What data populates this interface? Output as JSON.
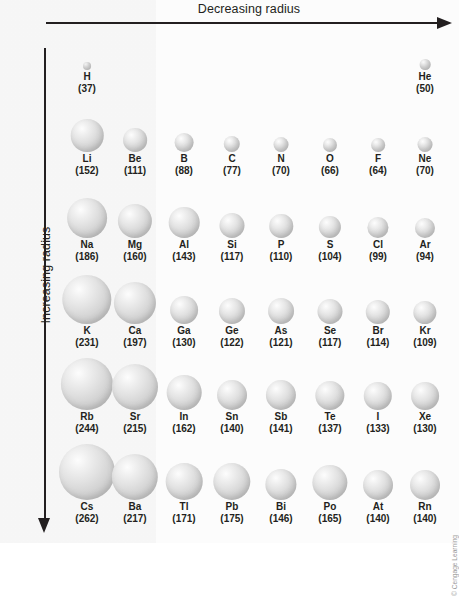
{
  "figure": {
    "top_axis_label": "Decreasing radius",
    "left_axis_label": "Increasing radius",
    "copyright": "© Cengage Learning"
  },
  "chart_data": {
    "type": "scatter",
    "xlabel": "Decreasing radius",
    "ylabel": "Increasing radius",
    "unit": "pm",
    "value_format": "(value)",
    "grid": false,
    "legend": "none",
    "note": "Sphere diameter is proportional to the atomic radius in picometres; value shown in parentheses under each element symbol.",
    "rows": [
      {
        "period": 1,
        "elements": [
          {
            "symbol": "H",
            "value": 37,
            "col": 1
          },
          {
            "symbol": "He",
            "value": 50,
            "col": 8
          }
        ]
      },
      {
        "period": 2,
        "elements": [
          {
            "symbol": "Li",
            "value": 152,
            "col": 1
          },
          {
            "symbol": "Be",
            "value": 111,
            "col": 2
          },
          {
            "symbol": "B",
            "value": 88,
            "col": 3
          },
          {
            "symbol": "C",
            "value": 77,
            "col": 4
          },
          {
            "symbol": "N",
            "value": 70,
            "col": 5
          },
          {
            "symbol": "O",
            "value": 66,
            "col": 6
          },
          {
            "symbol": "F",
            "value": 64,
            "col": 7
          },
          {
            "symbol": "Ne",
            "value": 70,
            "col": 8
          }
        ]
      },
      {
        "period": 3,
        "elements": [
          {
            "symbol": "Na",
            "value": 186,
            "col": 1
          },
          {
            "symbol": "Mg",
            "value": 160,
            "col": 2
          },
          {
            "symbol": "Al",
            "value": 143,
            "col": 3
          },
          {
            "symbol": "Si",
            "value": 117,
            "col": 4
          },
          {
            "symbol": "P",
            "value": 110,
            "col": 5
          },
          {
            "symbol": "S",
            "value": 104,
            "col": 6
          },
          {
            "symbol": "Cl",
            "value": 99,
            "col": 7
          },
          {
            "symbol": "Ar",
            "value": 94,
            "col": 8
          }
        ]
      },
      {
        "period": 4,
        "elements": [
          {
            "symbol": "K",
            "value": 231,
            "col": 1
          },
          {
            "symbol": "Ca",
            "value": 197,
            "col": 2
          },
          {
            "symbol": "Ga",
            "value": 130,
            "col": 3
          },
          {
            "symbol": "Ge",
            "value": 122,
            "col": 4
          },
          {
            "symbol": "As",
            "value": 121,
            "col": 5
          },
          {
            "symbol": "Se",
            "value": 117,
            "col": 6
          },
          {
            "symbol": "Br",
            "value": 114,
            "col": 7
          },
          {
            "symbol": "Kr",
            "value": 109,
            "col": 8
          }
        ]
      },
      {
        "period": 5,
        "elements": [
          {
            "symbol": "Rb",
            "value": 244,
            "col": 1
          },
          {
            "symbol": "Sr",
            "value": 215,
            "col": 2
          },
          {
            "symbol": "In",
            "value": 162,
            "col": 3
          },
          {
            "symbol": "Sn",
            "value": 140,
            "col": 4
          },
          {
            "symbol": "Sb",
            "value": 141,
            "col": 5
          },
          {
            "symbol": "Te",
            "value": 137,
            "col": 6
          },
          {
            "symbol": "I",
            "value": 133,
            "col": 7
          },
          {
            "symbol": "Xe",
            "value": 130,
            "col": 8
          }
        ]
      },
      {
        "period": 6,
        "elements": [
          {
            "symbol": "Cs",
            "value": 262,
            "col": 1
          },
          {
            "symbol": "Ba",
            "value": 217,
            "col": 2
          },
          {
            "symbol": "Tl",
            "value": 171,
            "col": 3
          },
          {
            "symbol": "Pb",
            "value": 175,
            "col": 4
          },
          {
            "symbol": "Bi",
            "value": 146,
            "col": 5
          },
          {
            "symbol": "Po",
            "value": 165,
            "col": 6
          },
          {
            "symbol": "At",
            "value": 140,
            "col": 7
          },
          {
            "symbol": "Rn",
            "value": 140,
            "col": 8
          }
        ]
      }
    ]
  },
  "layout": {
    "column_centers_px": [
      87,
      135,
      184,
      232,
      281,
      330,
      378,
      425
    ],
    "row_baselines_px": [
      70,
      152,
      238,
      324,
      410,
      500
    ],
    "px_per_pm": 0.214
  }
}
